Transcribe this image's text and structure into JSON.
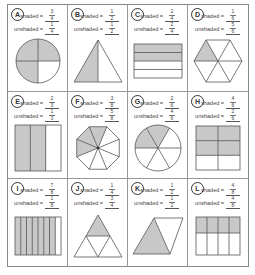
{
  "labels": {
    "shaded": "shaded =",
    "unshaded": "unshaded ="
  },
  "colors": {
    "shade": "#c8c8c8",
    "stroke": "#555555",
    "border": "#888888"
  },
  "problems": [
    {
      "letter": "A",
      "shape": "circle-quarters",
      "shaded": {
        "num": "3",
        "den": "4"
      },
      "unshaded": {
        "num": "1",
        "den": "4"
      }
    },
    {
      "letter": "B",
      "shape": "triangle-halves",
      "shaded": {
        "num": "1",
        "den": "2"
      },
      "unshaded": {
        "num": "1",
        "den": "2"
      }
    },
    {
      "letter": "C",
      "shape": "rectangle-4-rows",
      "shaded": {
        "num": "2",
        "den": "4"
      },
      "unshaded": {
        "num": "2",
        "den": "4"
      }
    },
    {
      "letter": "D",
      "shape": "hexagon-6",
      "shaded": {
        "num": "1",
        "den": "6"
      },
      "unshaded": {
        "num": "5",
        "den": "6"
      }
    },
    {
      "letter": "E",
      "shape": "rectangle-3-columns",
      "shaded": {
        "num": "2",
        "den": "3"
      },
      "unshaded": {
        "num": "1",
        "den": "3"
      }
    },
    {
      "letter": "F",
      "shape": "octagon-8",
      "shaded": {
        "num": "3",
        "den": "8"
      },
      "unshaded": {
        "num": "5",
        "den": "8"
      }
    },
    {
      "letter": "G",
      "shape": "circle-sixths",
      "shaded": {
        "num": "2",
        "den": "6"
      },
      "unshaded": {
        "num": "4",
        "den": "6"
      }
    },
    {
      "letter": "H",
      "shape": "square-6-grid",
      "shaded": {
        "num": "4",
        "den": "6"
      },
      "unshaded": {
        "num": "2",
        "den": "6"
      }
    },
    {
      "letter": "I",
      "shape": "rectangle-8-columns",
      "shaded": {
        "num": "7",
        "den": "8"
      },
      "unshaded": {
        "num": "1",
        "den": "8"
      }
    },
    {
      "letter": "J",
      "shape": "triangle-4",
      "shaded": {
        "num": "1",
        "den": "4"
      },
      "unshaded": {
        "num": "3",
        "den": "4"
      }
    },
    {
      "letter": "K",
      "shape": "rhombus-halves",
      "shaded": {
        "num": "1",
        "den": "2"
      },
      "unshaded": {
        "num": "1",
        "den": "2"
      }
    },
    {
      "letter": "L",
      "shape": "rectangle-8-grid",
      "shaded": {
        "num": "4",
        "den": "8"
      },
      "unshaded": {
        "num": "4",
        "den": "8"
      }
    }
  ]
}
